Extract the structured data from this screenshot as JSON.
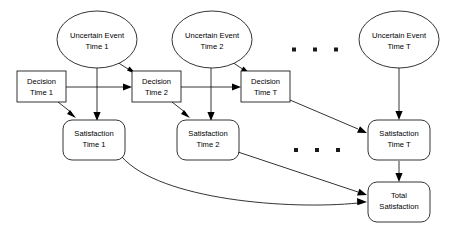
{
  "diagram": {
    "background_color": "#ffffff",
    "line_color": "#000000",
    "text_color": "#000000",
    "nodes": {
      "uncertain_event_1": {
        "line1": "Uncertain Event",
        "line2": "Time 1",
        "shape": "ellipse"
      },
      "uncertain_event_2": {
        "line1": "Uncertain Event",
        "line2": "Time 2",
        "shape": "ellipse"
      },
      "uncertain_event_t": {
        "line1": "Uncertain Event",
        "line2": "Time T",
        "shape": "ellipse"
      },
      "decision_1": {
        "line1": "Decision",
        "line2": "Time 1",
        "shape": "rectangle"
      },
      "decision_2": {
        "line1": "Decision",
        "line2": "Time 2",
        "shape": "rectangle"
      },
      "decision_t": {
        "line1": "Decision",
        "line2": "Time T",
        "shape": "rectangle"
      },
      "satisfaction_1": {
        "line1": "Satisfaction",
        "line2": "Time 1",
        "shape": "rounded-rectangle"
      },
      "satisfaction_2": {
        "line1": "Satisfaction",
        "line2": "Time 2",
        "shape": "rounded-rectangle"
      },
      "satisfaction_t": {
        "line1": "Satisfaction",
        "line2": "Time T",
        "shape": "rounded-rectangle"
      },
      "total_satisfaction": {
        "line1": "Total",
        "line2": "Satisfaction",
        "shape": "rounded-rectangle"
      }
    },
    "ellipsis": {
      "top_row": "· · ·",
      "middle_row": "· · ·"
    }
  }
}
